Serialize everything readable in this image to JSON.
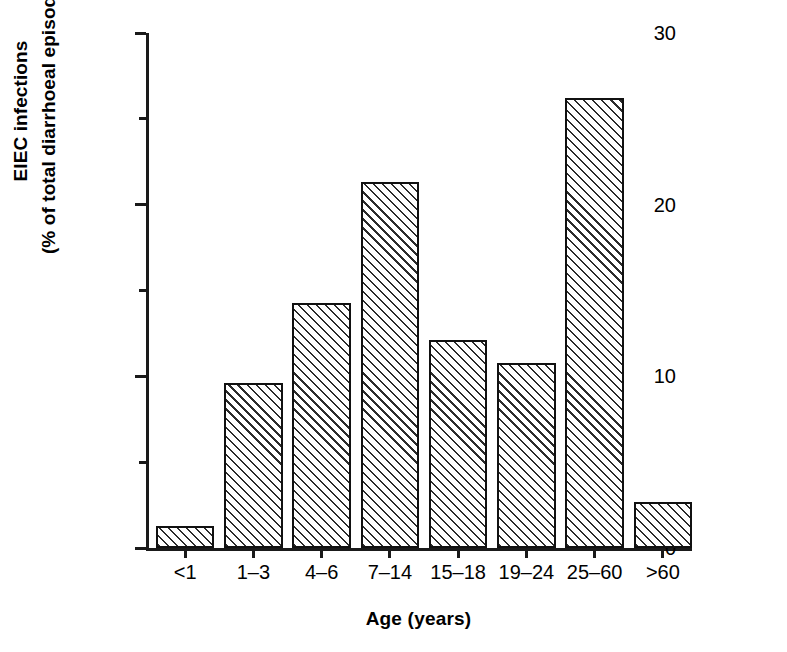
{
  "chart_data": {
    "type": "bar",
    "title": "",
    "subtitle": "",
    "xlabel": "Age (years)",
    "ylabel_line1": "EIEC infections",
    "ylabel_line2": "(% of total diarrhoeal episodes)",
    "categories": [
      "<1",
      "1–3",
      "4–6",
      "7–14",
      "15–18",
      "19–24",
      "25–60",
      ">60"
    ],
    "values": [
      1.3,
      9.6,
      14.3,
      21.3,
      12.1,
      10.8,
      26.2,
      2.7
    ],
    "ylim": [
      0,
      30
    ],
    "ytick_labels": [
      "0",
      "10",
      "20",
      "30"
    ],
    "ytick_values": [
      0,
      10,
      20,
      30
    ],
    "yminor_ticks": [
      5,
      15,
      25
    ],
    "grid": false,
    "legend": null,
    "bar_fill": "#ffffff",
    "bar_hatch": "diagonal-45",
    "bar_edge_color": "#111111",
    "axis_color": "#1a1a1a"
  }
}
